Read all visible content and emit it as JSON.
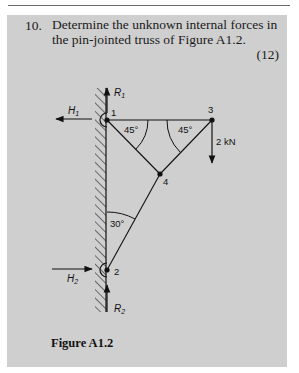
{
  "question": {
    "number": "10.",
    "text": "Determine the unknown internal forces in the pin-jointed truss of Figure A1.2.",
    "marks": "(12)"
  },
  "figure": {
    "caption": "Figure A1.2",
    "joints": [
      {
        "id": "1",
        "label": "1"
      },
      {
        "id": "2",
        "label": "2"
      },
      {
        "id": "3",
        "label": "3"
      },
      {
        "id": "4",
        "label": "4"
      }
    ],
    "reactions": {
      "r1": {
        "name": "R",
        "sub": "1"
      },
      "h1": {
        "name": "H",
        "sub": "1"
      },
      "r2": {
        "name": "R",
        "sub": "2"
      },
      "h2": {
        "name": "H",
        "sub": "2"
      }
    },
    "angles": {
      "at_joint1": "45°",
      "at_joint3": "45°",
      "at_joint2": "30°"
    },
    "load": "2 kN"
  },
  "colors": {
    "panel_bg": "#cfcfcf",
    "ink": "#111111"
  }
}
